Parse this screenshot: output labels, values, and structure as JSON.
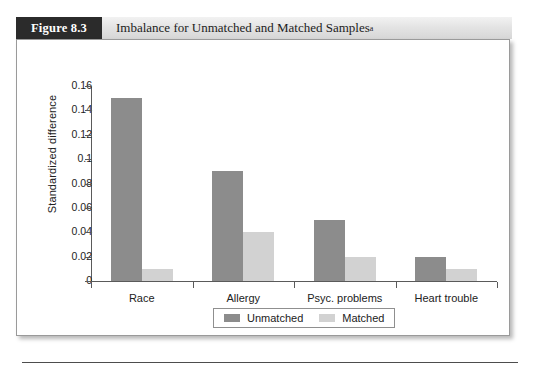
{
  "figure": {
    "number_label": "Figure 8.3",
    "title": "Imbalance for Unmatched and Matched Samples",
    "title_superscript": "a"
  },
  "chart_data": {
    "type": "bar",
    "title": "Imbalance for Unmatched and Matched Samples",
    "xlabel": "",
    "ylabel": "Standardized difference",
    "ylim": [
      0,
      0.16
    ],
    "ytick_labels": [
      "0",
      "0.02",
      "0.04",
      "0.06",
      "0.08",
      "0.1",
      "0.12",
      "0.14",
      "0.16"
    ],
    "ytick_values": [
      0,
      0.02,
      0.04,
      0.06,
      0.08,
      0.1,
      0.12,
      0.14,
      0.16
    ],
    "grid": false,
    "legend_position": "below-axis-center",
    "categories": [
      "Race",
      "Allergy",
      "Psyc. problems",
      "Heart trouble"
    ],
    "series": [
      {
        "name": "Unmatched",
        "color": "#8c8c8c",
        "values": [
          0.15,
          0.09,
          0.05,
          0.02
        ]
      },
      {
        "name": "Matched",
        "color": "#d2d2d2",
        "values": [
          0.01,
          0.04,
          0.02,
          0.01
        ]
      }
    ]
  },
  "colors": {
    "unmatched": "#8c8c8c",
    "matched": "#d2d2d2",
    "header_box": "#2b2b2b",
    "axis": "#5a5a5a"
  }
}
